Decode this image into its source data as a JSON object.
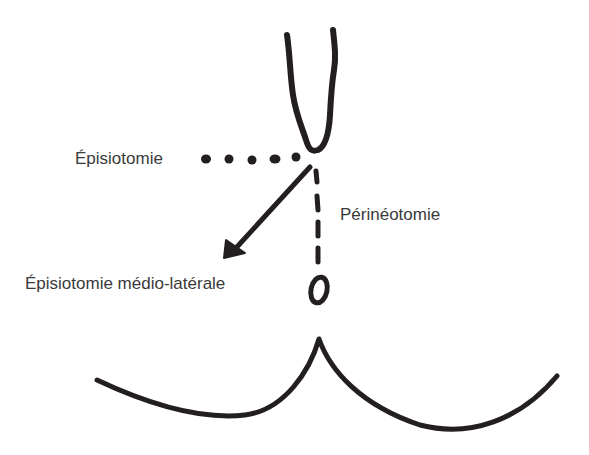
{
  "diagram": {
    "title": "",
    "labels": {
      "episiotomie": "Épisiotomie",
      "perineotomie": "Périnéotomie",
      "mediolaterale": "Épisiotomie médio-latérale"
    },
    "elements": [
      {
        "id": "vaginal-opening",
        "shape": "V-shaped curve",
        "description": "vulva / vaginal opening outline at top center"
      },
      {
        "id": "episiotomie-line",
        "style": "dotted",
        "direction": "horizontal left",
        "label": "Épisiotomie"
      },
      {
        "id": "mediolateral-arrow",
        "style": "solid arrow",
        "direction": "down-left diagonal",
        "label": "Épisiotomie médio-latérale"
      },
      {
        "id": "perineotomie-line",
        "style": "dashed",
        "direction": "vertical down",
        "label": "Périnéotomie"
      },
      {
        "id": "anus",
        "shape": "small oval"
      },
      {
        "id": "buttocks",
        "shape": "two arcs meeting at a central cusp"
      }
    ],
    "colors": {
      "ink": "#231f20",
      "text": "#3a3a3a",
      "background": "#ffffff"
    }
  }
}
